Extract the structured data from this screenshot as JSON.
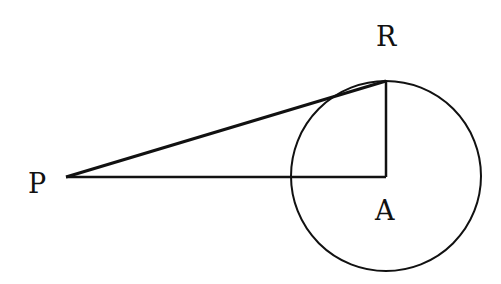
{
  "diagram": {
    "type": "geometry",
    "points": {
      "P": {
        "label": "P",
        "x": 66,
        "y": 177
      },
      "R": {
        "label": "R",
        "x": 386,
        "y": 81
      },
      "A": {
        "label": "A",
        "x": 386,
        "y": 177
      }
    },
    "circle": {
      "center": "A",
      "radius": 95
    },
    "segments": [
      [
        "P",
        "R"
      ],
      [
        "P",
        "A"
      ],
      [
        "R",
        "A"
      ]
    ],
    "colors": {
      "stroke": "#111111",
      "background": "#ffffff"
    }
  }
}
